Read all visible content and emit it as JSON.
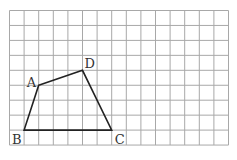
{
  "grid": {
    "origin_x": 9.5,
    "origin_y": 10.5,
    "cell_w": 14.6,
    "cell_h": 14.95,
    "cols": 15,
    "rows": 9,
    "line_color": "#a8a8a8"
  },
  "quadrilateral": {
    "stroke_color": "#222222",
    "vertices": [
      {
        "label": "A",
        "col": 2,
        "row": 5,
        "label_dx": -12,
        "label_dy": 2
      },
      {
        "label": "D",
        "col": 5,
        "row": 4,
        "label_dx": 2,
        "label_dy": -2
      },
      {
        "label": "C",
        "col": 7,
        "row": 8,
        "label_dx": 3,
        "label_dy": 14
      },
      {
        "label": "B",
        "col": 1,
        "row": 8,
        "label_dx": -12,
        "label_dy": 14
      }
    ]
  }
}
